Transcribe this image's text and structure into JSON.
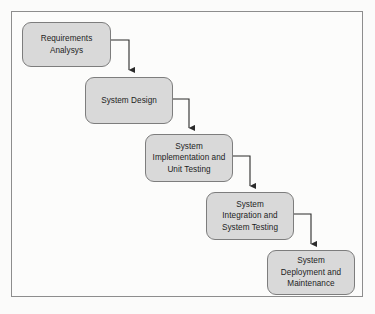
{
  "diagram": {
    "type": "flowchart",
    "orientation": "cascading-down-right",
    "frame": {
      "border_color": "#8d8d8d",
      "background": "#fcfcfb"
    },
    "style": {
      "node_fill": "#d9d9d9",
      "node_border": "#7d7d7d",
      "connector_color": "#2b2b2b",
      "text_color": "#1d1d1d",
      "page_background": "#fbfbfa"
    },
    "nodes": [
      {
        "id": "requirements-analysys",
        "label": "Requirements\nAnalysys",
        "x": 22,
        "y": 22,
        "width": 89,
        "height": 45
      },
      {
        "id": "system-design",
        "label": "System Design",
        "x": 85,
        "y": 77,
        "width": 88,
        "height": 47
      },
      {
        "id": "system-implementation-and-unit-testing",
        "label": "System\nImplementation and\nUnit Testing",
        "x": 145,
        "y": 134,
        "width": 88,
        "height": 48
      },
      {
        "id": "system-integration-and-system-testing",
        "label": "System\nIntegration and\nSystem Testing",
        "x": 206,
        "y": 192,
        "width": 88,
        "height": 48
      },
      {
        "id": "system-deployment-and-maintenance",
        "label": "System\nDeployment and\nMaintenance",
        "x": 267,
        "y": 250,
        "width": 88,
        "height": 45
      }
    ],
    "connectors": [
      {
        "id": "connector-1",
        "from": "requirements-analysys",
        "to": "system-design",
        "path": "M 111 40 L 129 40 L 129 70",
        "arrowhead": "down"
      },
      {
        "id": "connector-2",
        "from": "system-design",
        "to": "system-implementation-and-unit-testing",
        "path": "M 173 99 L 189 99 L 189 128",
        "arrowhead": "down"
      },
      {
        "id": "connector-3",
        "from": "system-implementation-and-unit-testing",
        "to": "system-integration-and-system-testing",
        "path": "M 233 156 L 250 156 L 250 186",
        "arrowhead": "down"
      },
      {
        "id": "connector-4",
        "from": "system-integration-and-system-testing",
        "to": "system-deployment-and-maintenance",
        "path": "M 294 214 L 311 214 L 311 244",
        "arrowhead": "down"
      }
    ]
  }
}
